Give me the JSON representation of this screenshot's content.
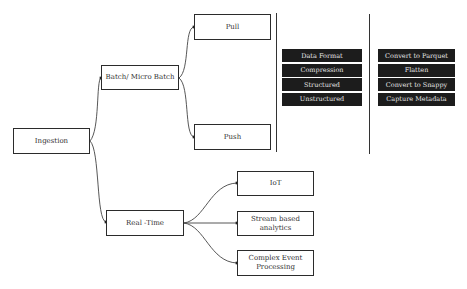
{
  "diagram": {
    "root": {
      "label": "Ingestion"
    },
    "batch": {
      "label": "Batch/ Micro Batch",
      "children": [
        {
          "label": "Pull"
        },
        {
          "label": "Push"
        }
      ]
    },
    "realtime": {
      "label": "Real -Time",
      "children": [
        {
          "label": "IoT"
        },
        {
          "label": "Stream based analytics"
        },
        {
          "label": "Complex Event Processing"
        }
      ]
    },
    "attributes": {
      "items": [
        "Data Format",
        "Compression",
        "Structured",
        "Unstructured"
      ]
    },
    "transformations": {
      "items": [
        "Convert to Parquet",
        "Flatten",
        "Convert to Snappy",
        "Capture Metadata"
      ]
    },
    "colors": {
      "line": "#333333",
      "dark_box": "#1c1c1c",
      "dark_text": "#e8e8e8"
    }
  }
}
